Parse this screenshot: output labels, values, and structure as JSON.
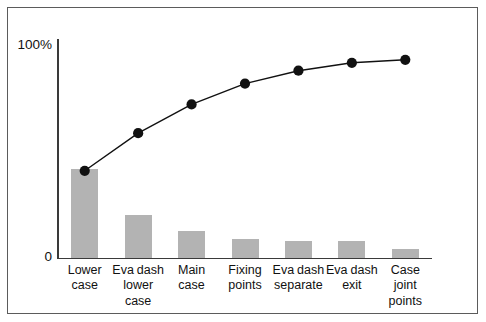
{
  "chart_data": {
    "type": "bar",
    "title": "",
    "subtitle": "",
    "xlabel": "",
    "ylabel": "",
    "ylim": [
      0,
      110
    ],
    "grid": false,
    "legend": "none",
    "axis": {
      "y_ticks": [
        "0",
        "100%"
      ],
      "y_tick_values": [
        0,
        100
      ]
    },
    "categories": [
      "Lower case",
      "Eva dash lower case",
      "Main case",
      "Fixing points",
      "Eva dash separate",
      "Eva dash exit",
      "Case joint points"
    ],
    "category_lines": [
      [
        "Lower",
        "case"
      ],
      [
        "Eva dash",
        "lower",
        "case"
      ],
      [
        "Main",
        "case"
      ],
      [
        "Fixing",
        "points"
      ],
      [
        "Eva dash",
        "separate"
      ],
      [
        "Eva dash",
        "exit"
      ],
      [
        "Case",
        "joint",
        "points"
      ]
    ],
    "series": [
      {
        "name": "Frequency",
        "type": "bar",
        "values": [
          45,
          21.5,
          13.7,
          9.6,
          8.7,
          8.7,
          4.6
        ],
        "color": "#b3b3b3"
      },
      {
        "name": "Cumulative percentage",
        "type": "line",
        "values": [
          44,
          63,
          77.5,
          88,
          94.5,
          98.5,
          100
        ],
        "color": "#111111",
        "marker": "circle"
      }
    ]
  },
  "chart": {
    "frame_color": "#5b5b5b",
    "axis_color": "#3a3a3a",
    "background": "#ffffff"
  }
}
